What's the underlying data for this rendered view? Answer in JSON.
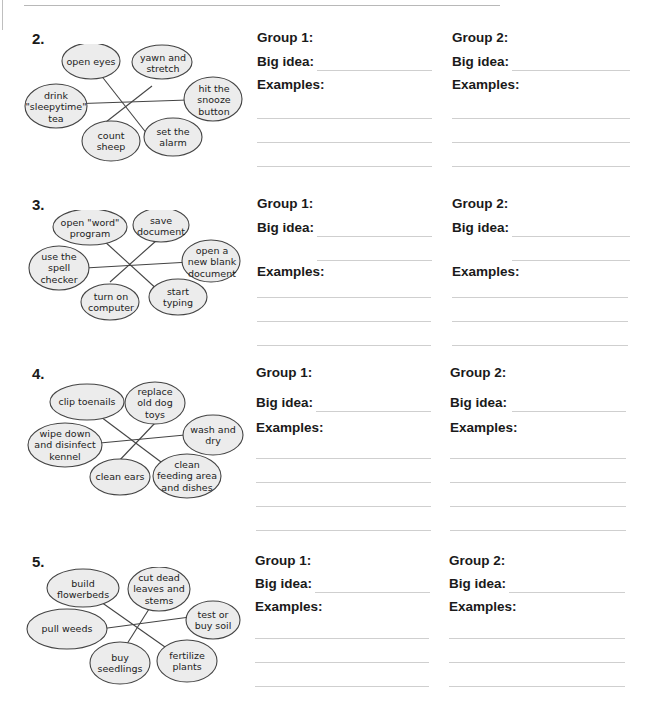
{
  "page": {
    "sections": [
      {
        "number": "2.",
        "bubbles": [
          "open eyes",
          "yawn and stretch",
          "hit the snooze button",
          "drink \"sleepytime\" tea",
          "count sheep",
          "set the alarm"
        ],
        "group1": {
          "title": "Group 1:",
          "big_idea_label": "Big idea:",
          "examples_label": "Examples:"
        },
        "group2": {
          "title": "Group 2:",
          "big_idea_label": "Big idea:",
          "examples_label": "Examples:"
        }
      },
      {
        "number": "3.",
        "bubbles": [
          "open \"word\" program",
          "save document",
          "open a new blank document",
          "use the spell checker",
          "turn on computer",
          "start typing"
        ],
        "group1": {
          "title": "Group 1:",
          "big_idea_label": "Big idea:",
          "examples_label": "Examples:"
        },
        "group2": {
          "title": "Group 2:",
          "big_idea_label": "Big idea:",
          "examples_label": "Examples:"
        }
      },
      {
        "number": "4.",
        "bubbles": [
          "clip toenails",
          "replace old dog toys",
          "wash and dry",
          "wipe down and disinfect kennel",
          "clean ears",
          "clean feeding area and dishes"
        ],
        "group1": {
          "title": "Group 1:",
          "big_idea_label": "Big idea:",
          "examples_label": "Examples:"
        },
        "group2": {
          "title": "Group 2:",
          "big_idea_label": "Big idea:",
          "examples_label": "Examples:"
        }
      },
      {
        "number": "5.",
        "bubbles": [
          "build flowerbeds",
          "cut dead leaves and stems",
          "test or buy soil",
          "pull weeds",
          "buy seedlings",
          "fertilize plants"
        ],
        "group1": {
          "title": "Group 1:",
          "big_idea_label": "Big idea:",
          "examples_label": "Examples:"
        },
        "group2": {
          "title": "Group 2:",
          "big_idea_label": "Big idea:",
          "examples_label": "Examples:"
        }
      }
    ]
  },
  "colors": {
    "bubble_fill": "#ececec",
    "bubble_stroke": "#444444",
    "rule": "#cfcfcf"
  }
}
